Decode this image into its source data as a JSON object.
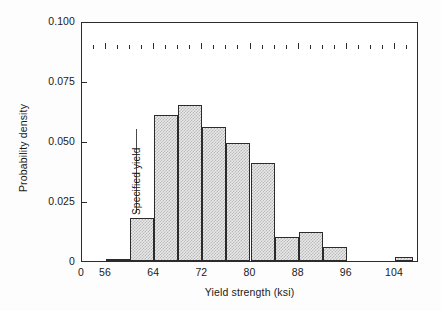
{
  "chart_data": {
    "type": "bar",
    "title": "",
    "subtitle": "",
    "xlabel": "Yield strength (ksi)",
    "ylabel": "Probability density",
    "xlim": [
      52,
      108
    ],
    "ylim": [
      0,
      0.1
    ],
    "grid": false,
    "legend": null,
    "bin_width": 4,
    "x_tick_labels": [
      "0",
      "56",
      "64",
      "72",
      "80",
      "88",
      "96",
      "104"
    ],
    "x_tick_values": [
      52,
      56,
      64,
      72,
      80,
      88,
      96,
      104
    ],
    "x_minor_tick_values": [
      54,
      58,
      60,
      62,
      66,
      68,
      70,
      74,
      76,
      78,
      82,
      84,
      86,
      90,
      92,
      94,
      98,
      100,
      102,
      106
    ],
    "y_tick_labels": [
      "0",
      "0.025",
      "0.050",
      "0.075",
      "0.100"
    ],
    "y_tick_values": [
      0,
      0.025,
      0.05,
      0.075,
      0.1
    ],
    "bins": [
      {
        "start": 56,
        "end": 60,
        "value": 0.0008
      },
      {
        "start": 60,
        "end": 64,
        "value": 0.018
      },
      {
        "start": 64,
        "end": 68,
        "value": 0.061
      },
      {
        "start": 68,
        "end": 72,
        "value": 0.065
      },
      {
        "start": 72,
        "end": 76,
        "value": 0.056
      },
      {
        "start": 76,
        "end": 80,
        "value": 0.049
      },
      {
        "start": 80,
        "end": 84,
        "value": 0.041
      },
      {
        "start": 84,
        "end": 88,
        "value": 0.01
      },
      {
        "start": 88,
        "end": 92,
        "value": 0.012
      },
      {
        "start": 92,
        "end": 96,
        "value": 0.006
      },
      {
        "start": 104,
        "end": 107,
        "value": 0.0015
      }
    ],
    "annotations": [
      {
        "name": "specified-yield",
        "label": "Specified yield",
        "x_value": 61.2,
        "line_y_from": 0.0205,
        "line_y_to": 0.0555
      }
    ],
    "colors": {
      "bar_fill": "#e9e9e9",
      "bar_pattern": "#b9b9b9",
      "bar_edge": "#2b2b2b",
      "axis": "#2b2b2b",
      "text": "#1a1a1a",
      "background": "#ffffff"
    }
  }
}
